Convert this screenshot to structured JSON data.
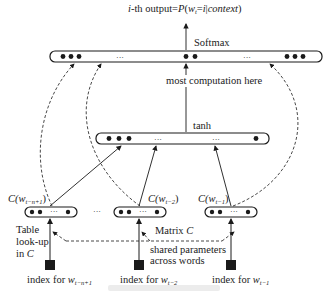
{
  "diagram": {
    "type": "neural-probabilistic-language-model",
    "output_label_prefix": "i",
    "output_label_mid": "-th output=",
    "output_label_formula_p": "P",
    "output_label_formula_w": "w",
    "output_label_formula_sub": "t",
    "output_label_formula_eq": "=",
    "output_label_formula_i": "i",
    "output_label_formula_bar": "|",
    "output_label_formula_ctx": "context",
    "softmax_label": "Softmax",
    "computation_note": "most computation here",
    "tanh_label": "tanh",
    "ellipsis": "···",
    "embeddings": [
      {
        "label_c": "C(w",
        "label_sub": "t−n+1",
        "label_close": ")"
      },
      {
        "label_c": "C(w",
        "label_sub": "t−2",
        "label_close": ")"
      },
      {
        "label_c": "C(w",
        "label_sub": "t−1",
        "label_close": ")"
      }
    ],
    "table_lookup_line1": "Table",
    "table_lookup_line2": "look-up",
    "table_lookup_line3_prefix": "in ",
    "table_lookup_line3_c": "C",
    "matrix_label_prefix": "Matrix ",
    "matrix_label_c": "C",
    "shared_line1": "shared parameters",
    "shared_line2": "across words",
    "indices": [
      {
        "prefix": "index for ",
        "w": "w",
        "sub": "t−n+1"
      },
      {
        "prefix": "index for ",
        "w": "w",
        "sub": "t−2"
      },
      {
        "prefix": "index for ",
        "w": "w",
        "sub": "t−1"
      }
    ],
    "colors": {
      "ink": "#1a1a1a",
      "background": "#ffffff"
    }
  }
}
